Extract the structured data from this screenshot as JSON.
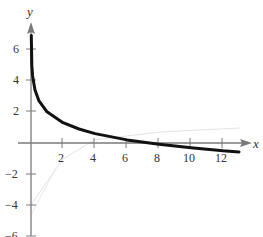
{
  "chart_data": {
    "type": "line",
    "title": "",
    "xlabel": "x",
    "ylabel": "y",
    "xlim": [
      0,
      13
    ],
    "ylim": [
      -6,
      7
    ],
    "x_ticks": [
      2,
      4,
      6,
      8,
      10,
      12
    ],
    "y_ticks": [
      -6,
      -4,
      -2,
      2,
      4,
      6
    ],
    "grid": false,
    "legend": null,
    "series": [
      {
        "name": "curve",
        "style": "thick black",
        "x": [
          0.02,
          0.05,
          0.1,
          0.25,
          0.5,
          1,
          2,
          3,
          4,
          6,
          8,
          10,
          12,
          13
        ],
        "values": [
          6.9,
          5.0,
          4.3,
          3.4,
          2.7,
          2.0,
          1.3,
          0.9,
          0.6,
          0.2,
          -0.08,
          -0.3,
          -0.5,
          -0.57
        ]
      }
    ]
  },
  "axes": {
    "x_name": "x",
    "y_name": "y",
    "x_tick_labels": [
      "2",
      "4",
      "6",
      "8",
      "10",
      "12"
    ],
    "y_tick_labels": [
      "6",
      "4",
      "2",
      "−2",
      "−4",
      "−6"
    ]
  },
  "colors": {
    "axis": "#7a7a7a",
    "curve": "#111111",
    "faint": "#d8d8d8"
  }
}
